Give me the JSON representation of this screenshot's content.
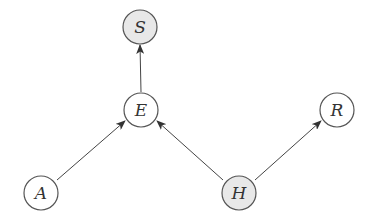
{
  "diagram": {
    "type": "bayesian-network",
    "nodes": [
      {
        "id": "S",
        "label": "S",
        "cx": 140,
        "cy": 27,
        "shaded": true
      },
      {
        "id": "E",
        "label": "E",
        "cx": 141,
        "cy": 110,
        "shaded": false
      },
      {
        "id": "R",
        "label": "R",
        "cx": 337,
        "cy": 110,
        "shaded": false
      },
      {
        "id": "A",
        "label": "A",
        "cx": 41,
        "cy": 193,
        "shaded": false
      },
      {
        "id": "H",
        "label": "H",
        "cx": 239,
        "cy": 193,
        "shaded": true
      }
    ],
    "edges": [
      {
        "from": "E",
        "to": "S"
      },
      {
        "from": "A",
        "to": "E"
      },
      {
        "from": "H",
        "to": "E"
      },
      {
        "from": "H",
        "to": "R"
      }
    ],
    "colors": {
      "stroke": "#555555",
      "shaded_fill": "#e8e8e8",
      "plain_fill": "#ffffff",
      "edge": "#444444"
    }
  }
}
